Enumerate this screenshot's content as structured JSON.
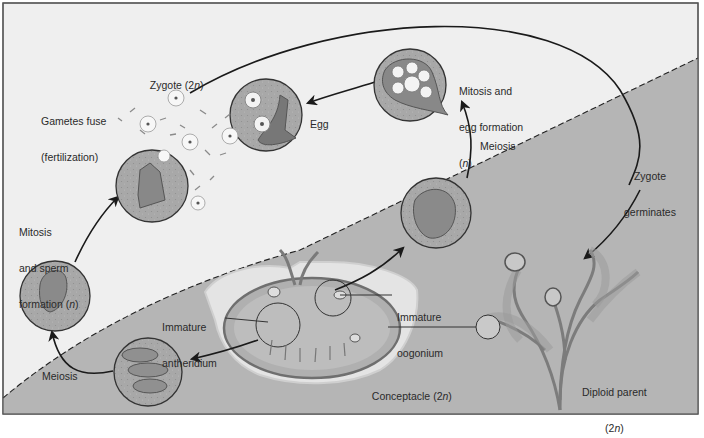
{
  "diagram": {
    "colors": {
      "haploid_region": "#efefef",
      "diploid_region": "#b5b5b5",
      "frame": "#555555",
      "arrow": "#1a1a1a",
      "cell_fill": "#9a9a9a",
      "circle_stroke": "#333333"
    },
    "regions": [
      {
        "id": "haploid",
        "ploidy": "n",
        "position": "upper-left"
      },
      {
        "id": "diploid",
        "ploidy": "2n",
        "position": "lower-right"
      }
    ],
    "labels": {
      "zygote": {
        "text": "Zygote (2",
        "italic": "n",
        "close": ")"
      },
      "gametes_fuse": {
        "line1": "Gametes fuse",
        "line2": "(fertilization)"
      },
      "egg": "Egg",
      "mitosis_egg": {
        "line1": "Mitosis and",
        "line2": "egg formation",
        "line3_open": "(",
        "line3_italic": "n",
        "line3_close": ")"
      },
      "meiosis_right": "Meiosis",
      "zygote_germinates": {
        "line1": "Zygote",
        "line2": "germinates"
      },
      "mitosis_sperm": {
        "line1": "Mitosis",
        "line2": "and sperm",
        "line3": "formation (",
        "line3_italic": "n",
        "line3_close": ")"
      },
      "immature_antheridium": {
        "line1": "Immature",
        "line2": "antheridium"
      },
      "immature_oogonium": {
        "line1": "Immature",
        "line2": "oogonium"
      },
      "meiosis_left": "Meiosis",
      "conceptacle": {
        "text": "Conceptacle (2",
        "italic": "n",
        "close": ")"
      },
      "diploid_parent": {
        "line1": "Diploid parent",
        "line2_open": "(2",
        "line2_italic": "n",
        "line2_close": ")"
      }
    },
    "stages": [
      {
        "id": "diploid-parent",
        "label": "Diploid parent (2n)"
      },
      {
        "id": "conceptacle",
        "label": "Conceptacle (2n)"
      },
      {
        "id": "immature-oogonium",
        "label": "Immature oogonium"
      },
      {
        "id": "immature-antheridium",
        "label": "Immature antheridium"
      },
      {
        "id": "meiosis-female",
        "label": "Meiosis"
      },
      {
        "id": "egg-formation",
        "label": "Mitosis and egg formation (n)"
      },
      {
        "id": "egg",
        "label": "Egg"
      },
      {
        "id": "meiosis-male",
        "label": "Meiosis"
      },
      {
        "id": "sperm-formation",
        "label": "Mitosis and sperm formation (n)"
      },
      {
        "id": "fertilization",
        "label": "Gametes fuse (fertilization)"
      },
      {
        "id": "zygote",
        "label": "Zygote (2n)"
      },
      {
        "id": "zygote-germinates",
        "label": "Zygote germinates"
      }
    ]
  }
}
